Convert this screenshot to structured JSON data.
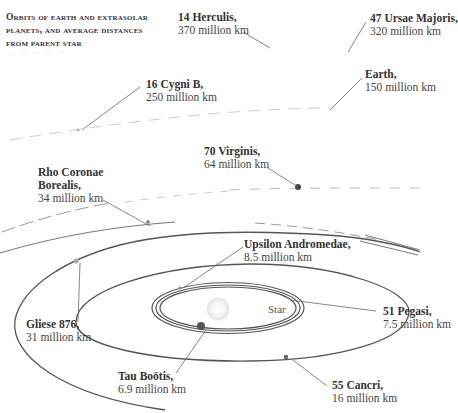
{
  "title": {
    "lines": [
      "Orbits of earth and extrasolar",
      "planets, and average distances",
      "from parent star"
    ]
  },
  "star": {
    "label": "Star"
  },
  "planets": [
    {
      "id": "14-herculis",
      "name": "14 Herculis,",
      "distance": "370 million km",
      "distance_mkm": 370
    },
    {
      "id": "47-ursae-majoris",
      "name": "47 Ursae Majoris,",
      "distance": "320 million km",
      "distance_mkm": 320
    },
    {
      "id": "16-cygni-b",
      "name": "16 Cygni B,",
      "distance": "250 million km",
      "distance_mkm": 250
    },
    {
      "id": "earth",
      "name": "Earth,",
      "distance": "150 million km",
      "distance_mkm": 150
    },
    {
      "id": "70-virginis",
      "name": "70 Virginis,",
      "distance": "64 million km",
      "distance_mkm": 64
    },
    {
      "id": "rho-coronae-borealis",
      "name_line1": "Rho Coronae",
      "name_line2": "Borealis,",
      "distance": "34 million km",
      "distance_mkm": 34
    },
    {
      "id": "upsilon-andromedae",
      "name": "Upsilon Andromedae,",
      "distance": "8.5 million km",
      "distance_mkm": 8.5
    },
    {
      "id": "51-pegasi",
      "name": "51 Pegasi,",
      "distance": "7.5 million km",
      "distance_mkm": 7.5
    },
    {
      "id": "gliese-876",
      "name": "Gliese 876,",
      "distance": "31 million km",
      "distance_mkm": 31
    },
    {
      "id": "tau-bootis",
      "name": "Tau Boötis,",
      "distance": "6.9 million km",
      "distance_mkm": 6.9
    },
    {
      "id": "55-cancri",
      "name": "55 Cancri,",
      "distance": "16 million km",
      "distance_mkm": 16
    }
  ],
  "colors": {
    "orbit_line": "#555555",
    "faint_orbit": "#bbbbbb",
    "planet_dot": "#444444",
    "star_glow": "#e6e6e6",
    "text": "#333333"
  }
}
